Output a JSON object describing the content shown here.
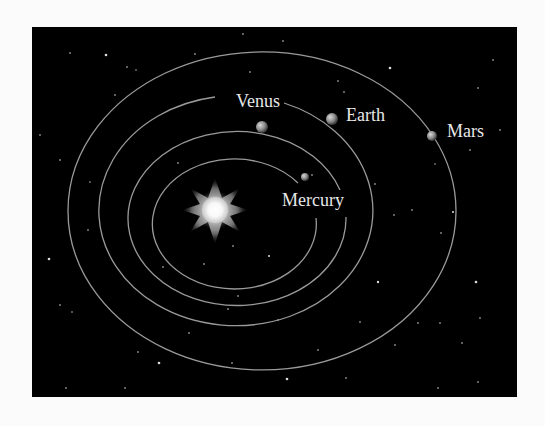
{
  "diagram": {
    "sun": {
      "label": "",
      "cx": 215,
      "cy": 210
    },
    "planets": [
      {
        "name": "Mercury",
        "label": "Mercury"
      },
      {
        "name": "Venus",
        "label": "Venus"
      },
      {
        "name": "Earth",
        "label": "Earth"
      },
      {
        "name": "Mars",
        "label": "Mars"
      }
    ],
    "colors": {
      "background": "#000000",
      "orbit": "#9a9a9a",
      "label": "#e8e8e8",
      "page": "#fbfbfb"
    }
  }
}
